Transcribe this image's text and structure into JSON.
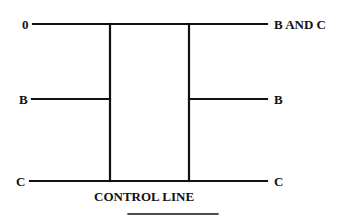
{
  "diagram": {
    "type": "switching-network",
    "line_color": "#111111",
    "background": "#ffffff",
    "inputs": [
      {
        "label": "0",
        "y": 24
      },
      {
        "label": "B",
        "y": 99
      },
      {
        "label": "C",
        "y": 181
      }
    ],
    "outputs": [
      {
        "label": "B AND C",
        "y": 24
      },
      {
        "label": "B",
        "y": 99
      },
      {
        "label": "C",
        "y": 181
      }
    ],
    "control_label": "CONTROL LINE"
  }
}
